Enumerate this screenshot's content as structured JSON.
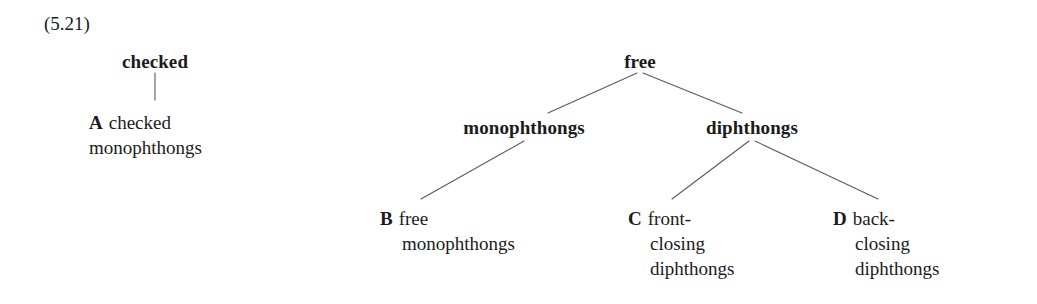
{
  "figure": {
    "number": "(5.21)",
    "background_color": "#ffffff",
    "text_color": "#1b1b1b",
    "line_color": "#5a5a5a"
  },
  "trees": [
    {
      "id": "checked-tree",
      "root": "checked",
      "leaves": [
        {
          "marker": "A",
          "lines": [
            "checked",
            "monophthongs"
          ],
          "indent_continuation": false
        }
      ]
    },
    {
      "id": "free-tree",
      "root": "free",
      "children": [
        {
          "label": "monophthongs",
          "leaves": [
            {
              "marker": "B",
              "lines": [
                "free",
                "monophthongs"
              ],
              "indent_continuation": true
            }
          ]
        },
        {
          "label": "diphthongs",
          "leaves": [
            {
              "marker": "C",
              "lines": [
                "front-",
                "closing",
                "diphthongs"
              ],
              "indent_continuation": true
            },
            {
              "marker": "D",
              "lines": [
                "back-",
                "closing",
                "diphthongs"
              ],
              "indent_continuation": true
            }
          ]
        }
      ]
    }
  ],
  "nodes": {
    "checked": "checked",
    "free": "free",
    "monophthongs": "monophthongs",
    "diphthongs": "diphthongs"
  },
  "leaf_a": {
    "marker": "A",
    "line1": "checked",
    "line2": "monophthongs"
  },
  "leaf_b": {
    "marker": "B",
    "line1": "free",
    "line2": "monophthongs"
  },
  "leaf_c": {
    "marker": "C",
    "line1": "front-",
    "line2": "closing",
    "line3": "diphthongs"
  },
  "leaf_d": {
    "marker": "D",
    "line1": "back-",
    "line2": "closing",
    "line3": "diphthongs"
  }
}
